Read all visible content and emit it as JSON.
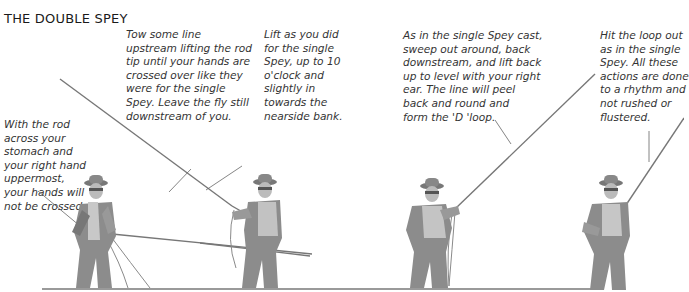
{
  "title": "THE DOUBLE SPEY",
  "steps": [
    {
      "id": 1,
      "caption": "With the rod\nacross your\nstomach and\nyour right hand\nuppermost,\nyour hands will\nnot be crossed."
    },
    {
      "id": 2,
      "caption": "Tow some line\nupstream lifting the rod\ntip until your hands are\ncrossed over like they\nwere for the single\nSpey. Leave the fly still\ndownstream of you."
    },
    {
      "id": 3,
      "caption": "Lift as you did\nfor the single\nSpey, up to 10\no'clock and\nslightly in\ntowards the\nnearside bank."
    },
    {
      "id": 4,
      "caption": "As in the single Spey cast,\nsweep out around, back\ndownstream, and lift back\nup to level with your right\near. The line will peel\nback and round and\nform the 'D 'loop."
    },
    {
      "id": 5,
      "caption": "Hit the loop out\nas in the single\nSpey. All these\nactions are done\nto a rhythm and\nnot rushed or\nflustered."
    }
  ],
  "colors": {
    "figure": "#8c8c8c",
    "figure_dark": "#6e6e6e",
    "line": "#7a7a7a",
    "ground": "#999999",
    "text": "#333333"
  }
}
